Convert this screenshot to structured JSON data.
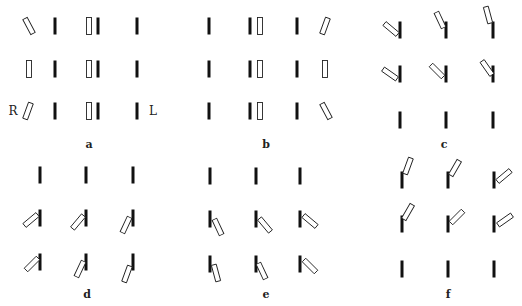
{
  "figure": {
    "bar_length": 17,
    "bar_width": 3,
    "open_width": 5,
    "black_color": "#111111",
    "open_stroke": "#222222",
    "side_labels": [
      {
        "text": "R",
        "x": 13,
        "y": 115
      },
      {
        "text": "L",
        "x": 153,
        "y": 115
      }
    ],
    "panels": [
      {
        "label": "a",
        "label_x": 89,
        "label_y": 148,
        "bars": [
          {
            "type": "black",
            "x": 55,
            "y": 26,
            "angle": 0
          },
          {
            "type": "black",
            "x": 98,
            "y": 26,
            "angle": 0
          },
          {
            "type": "black",
            "x": 137,
            "y": 26,
            "angle": 0
          },
          {
            "type": "black",
            "x": 55,
            "y": 69,
            "angle": 0
          },
          {
            "type": "black",
            "x": 98,
            "y": 69,
            "angle": 0
          },
          {
            "type": "black",
            "x": 137,
            "y": 69,
            "angle": 0
          },
          {
            "type": "black",
            "x": 55,
            "y": 111,
            "angle": 0
          },
          {
            "type": "black",
            "x": 98,
            "y": 111,
            "angle": 0
          },
          {
            "type": "black",
            "x": 137,
            "y": 111,
            "angle": 0
          },
          {
            "type": "open",
            "x": 29,
            "y": 26,
            "angle": -28
          },
          {
            "type": "open",
            "x": 29,
            "y": 69,
            "angle": 0
          },
          {
            "type": "open",
            "x": 28,
            "y": 111,
            "angle": 20
          },
          {
            "type": "open",
            "x": 89,
            "y": 26,
            "angle": 0
          },
          {
            "type": "open",
            "x": 89,
            "y": 69,
            "angle": 0
          },
          {
            "type": "open",
            "x": 89,
            "y": 111,
            "angle": 0
          }
        ]
      },
      {
        "label": "b",
        "label_x": 266,
        "label_y": 148,
        "bars": [
          {
            "type": "black",
            "x": 209,
            "y": 26,
            "angle": 0
          },
          {
            "type": "black",
            "x": 250,
            "y": 26,
            "angle": 0
          },
          {
            "type": "black",
            "x": 297,
            "y": 26,
            "angle": 0
          },
          {
            "type": "black",
            "x": 209,
            "y": 69,
            "angle": 0
          },
          {
            "type": "black",
            "x": 250,
            "y": 69,
            "angle": 0
          },
          {
            "type": "black",
            "x": 297,
            "y": 69,
            "angle": 0
          },
          {
            "type": "black",
            "x": 209,
            "y": 111,
            "angle": 0
          },
          {
            "type": "black",
            "x": 250,
            "y": 111,
            "angle": 0
          },
          {
            "type": "black",
            "x": 297,
            "y": 111,
            "angle": 0
          },
          {
            "type": "open",
            "x": 260,
            "y": 26,
            "angle": 0
          },
          {
            "type": "open",
            "x": 260,
            "y": 69,
            "angle": 0
          },
          {
            "type": "open",
            "x": 260,
            "y": 111,
            "angle": 0
          },
          {
            "type": "open",
            "x": 325,
            "y": 26,
            "angle": 20
          },
          {
            "type": "open",
            "x": 325,
            "y": 69,
            "angle": 0
          },
          {
            "type": "open",
            "x": 326,
            "y": 111,
            "angle": -28
          }
        ]
      },
      {
        "label": "c",
        "label_x": 444,
        "label_y": 148,
        "bars": [
          {
            "type": "black",
            "x": 400,
            "y": 30,
            "angle": 0
          },
          {
            "type": "black",
            "x": 446,
            "y": 30,
            "angle": 0
          },
          {
            "type": "black",
            "x": 493,
            "y": 30,
            "angle": 0
          },
          {
            "type": "black",
            "x": 400,
            "y": 74,
            "angle": 0
          },
          {
            "type": "black",
            "x": 446,
            "y": 74,
            "angle": 0
          },
          {
            "type": "black",
            "x": 493,
            "y": 74,
            "angle": 0
          },
          {
            "type": "black",
            "x": 400,
            "y": 120,
            "angle": 0
          },
          {
            "type": "black",
            "x": 446,
            "y": 120,
            "angle": 0
          },
          {
            "type": "black",
            "x": 493,
            "y": 120,
            "angle": 0
          },
          {
            "type": "open",
            "x": 391,
            "y": 29,
            "angle": -50
          },
          {
            "type": "open",
            "x": 440,
            "y": 20,
            "angle": -25
          },
          {
            "type": "open",
            "x": 488,
            "y": 15,
            "angle": -15
          },
          {
            "type": "open",
            "x": 390,
            "y": 74,
            "angle": -55
          },
          {
            "type": "open",
            "x": 437,
            "y": 71,
            "angle": -45
          },
          {
            "type": "open",
            "x": 487,
            "y": 68,
            "angle": -35
          }
        ]
      },
      {
        "label": "d",
        "label_x": 87,
        "label_y": 298,
        "bars": [
          {
            "type": "black",
            "x": 40,
            "y": 175,
            "angle": 0
          },
          {
            "type": "black",
            "x": 86,
            "y": 175,
            "angle": 0
          },
          {
            "type": "black",
            "x": 133,
            "y": 175,
            "angle": 0
          },
          {
            "type": "black",
            "x": 40,
            "y": 218,
            "angle": 0
          },
          {
            "type": "black",
            "x": 86,
            "y": 218,
            "angle": 0
          },
          {
            "type": "black",
            "x": 133,
            "y": 218,
            "angle": 0
          },
          {
            "type": "black",
            "x": 40,
            "y": 262,
            "angle": 0
          },
          {
            "type": "black",
            "x": 86,
            "y": 262,
            "angle": 0
          },
          {
            "type": "black",
            "x": 133,
            "y": 262,
            "angle": 0
          },
          {
            "type": "open",
            "x": 31,
            "y": 220,
            "angle": 50
          },
          {
            "type": "open",
            "x": 78,
            "y": 222,
            "angle": 40
          },
          {
            "type": "open",
            "x": 126,
            "y": 225,
            "angle": 25
          },
          {
            "type": "open",
            "x": 32,
            "y": 264,
            "angle": 45
          },
          {
            "type": "open",
            "x": 80,
            "y": 269,
            "angle": 25
          },
          {
            "type": "open",
            "x": 127,
            "y": 274,
            "angle": 20
          }
        ]
      },
      {
        "label": "e",
        "label_x": 266,
        "label_y": 298,
        "bars": [
          {
            "type": "black",
            "x": 210,
            "y": 176,
            "angle": 0
          },
          {
            "type": "black",
            "x": 256,
            "y": 176,
            "angle": 0
          },
          {
            "type": "black",
            "x": 300,
            "y": 176,
            "angle": 0
          },
          {
            "type": "black",
            "x": 210,
            "y": 219,
            "angle": 0
          },
          {
            "type": "black",
            "x": 256,
            "y": 219,
            "angle": 0
          },
          {
            "type": "black",
            "x": 300,
            "y": 219,
            "angle": 0
          },
          {
            "type": "black",
            "x": 210,
            "y": 264,
            "angle": 0
          },
          {
            "type": "black",
            "x": 256,
            "y": 264,
            "angle": 0
          },
          {
            "type": "black",
            "x": 300,
            "y": 264,
            "angle": 0
          },
          {
            "type": "open",
            "x": 218,
            "y": 227,
            "angle": -25
          },
          {
            "type": "open",
            "x": 265,
            "y": 225,
            "angle": -40
          },
          {
            "type": "open",
            "x": 310,
            "y": 221,
            "angle": -50
          },
          {
            "type": "open",
            "x": 216,
            "y": 273,
            "angle": -15
          },
          {
            "type": "open",
            "x": 262,
            "y": 271,
            "angle": -25
          },
          {
            "type": "open",
            "x": 310,
            "y": 266,
            "angle": -45
          }
        ]
      },
      {
        "label": "f",
        "label_x": 448,
        "label_y": 298,
        "bars": [
          {
            "type": "black",
            "x": 402,
            "y": 180,
            "angle": 0
          },
          {
            "type": "black",
            "x": 448,
            "y": 180,
            "angle": 0
          },
          {
            "type": "black",
            "x": 494,
            "y": 180,
            "angle": 0
          },
          {
            "type": "black",
            "x": 402,
            "y": 224,
            "angle": 0
          },
          {
            "type": "black",
            "x": 448,
            "y": 224,
            "angle": 0
          },
          {
            "type": "black",
            "x": 494,
            "y": 224,
            "angle": 0
          },
          {
            "type": "black",
            "x": 402,
            "y": 269,
            "angle": 0
          },
          {
            "type": "black",
            "x": 448,
            "y": 269,
            "angle": 0
          },
          {
            "type": "black",
            "x": 494,
            "y": 269,
            "angle": 0
          },
          {
            "type": "open",
            "x": 408,
            "y": 166,
            "angle": 20
          },
          {
            "type": "open",
            "x": 455,
            "y": 168,
            "angle": 30
          },
          {
            "type": "open",
            "x": 504,
            "y": 176,
            "angle": 50
          },
          {
            "type": "open",
            "x": 408,
            "y": 212,
            "angle": 30
          },
          {
            "type": "open",
            "x": 457,
            "y": 217,
            "angle": 45
          },
          {
            "type": "open",
            "x": 505,
            "y": 220,
            "angle": 55
          }
        ]
      }
    ]
  }
}
